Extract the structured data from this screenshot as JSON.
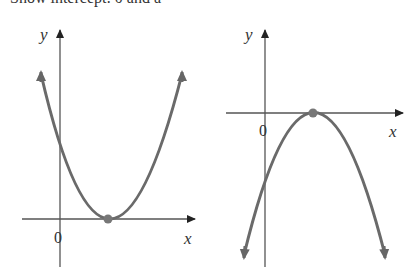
{
  "caption": "Show intercept: 0 and a",
  "colors": {
    "axis": "#555555",
    "curve": "#6a6a6a",
    "vertex": "#777777"
  },
  "graphs": [
    {
      "name": "upward-parabola",
      "y_label": "y",
      "x_label": "x",
      "origin_label": "0",
      "vertex": "on x-axis, right of origin",
      "opens": "up"
    },
    {
      "name": "downward-parabola",
      "y_label": "y",
      "x_label": "x",
      "origin_label": "0",
      "vertex": "on x-axis, right of origin",
      "opens": "down"
    }
  ]
}
